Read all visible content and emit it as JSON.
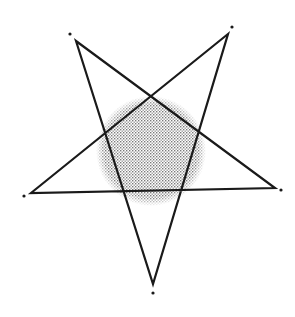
{
  "figure": {
    "type": "pentagram-with-shaded-circle",
    "width": 295,
    "height": 317,
    "background": "#ffffff",
    "stroke_color": "#1a1a1a",
    "stroke_width": 2.2,
    "circle": {
      "cx": 151,
      "cy": 151,
      "r": 55,
      "fill_pattern": "halftone-dither",
      "dot_color": "#8a8a8a"
    },
    "vertices": [
      {
        "name": "top-left",
        "x": 76,
        "y": 41
      },
      {
        "name": "top-right",
        "x": 228,
        "y": 34
      },
      {
        "name": "right",
        "x": 275,
        "y": 188
      },
      {
        "name": "bottom",
        "x": 153,
        "y": 284
      },
      {
        "name": "left",
        "x": 31,
        "y": 193
      }
    ],
    "star_order": [
      "top-left",
      "right",
      "left",
      "top-right",
      "bottom"
    ],
    "marker_dots": [
      {
        "name": "top-left-dot",
        "x": 70,
        "y": 34
      },
      {
        "name": "top-right-dot",
        "x": 232,
        "y": 27
      },
      {
        "name": "right-dot",
        "x": 281,
        "y": 190
      },
      {
        "name": "bottom-dot",
        "x": 153,
        "y": 293
      },
      {
        "name": "left-dot",
        "x": 24,
        "y": 196
      }
    ],
    "marker_dot_radius": 1.6
  }
}
